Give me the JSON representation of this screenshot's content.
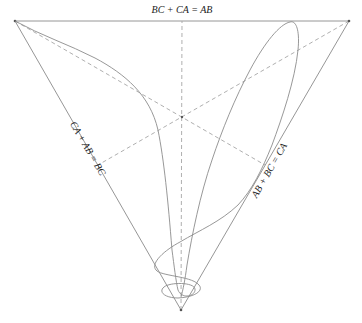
{
  "diagram": {
    "type": "triangle-constraint-plot",
    "labels": {
      "top_edge": "BC + CA = AB",
      "left_edge": "CA + AB = BC",
      "right_edge": "AB + BC = CA"
    },
    "vertices": {
      "top_left": [
        15,
        21
      ],
      "top_right": [
        349,
        21
      ],
      "bottom": [
        181,
        310
      ]
    },
    "centroid": [
      182,
      117
    ],
    "colors": {
      "edge": "#8a8a8a",
      "median": "#a6a6a6",
      "curve": "#8c8c8c",
      "label": "#222222"
    }
  }
}
